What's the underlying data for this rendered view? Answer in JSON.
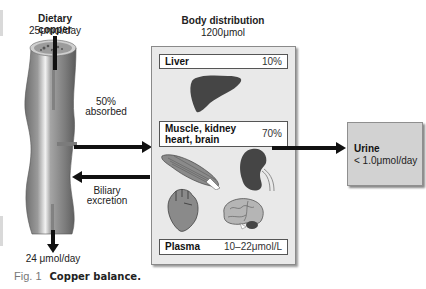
{
  "intake": {
    "title": "Dietary copper",
    "rate": "25μmol/day"
  },
  "distribution": {
    "title": "Body distribution",
    "total": "1200μmol",
    "compartments": [
      {
        "name": "Liver",
        "percent": "10%"
      },
      {
        "name": "Muscle, kidney heart, brain",
        "name_line1": "Muscle, kidney",
        "name_line2": "heart, brain",
        "percent": "70%"
      },
      {
        "name": "Plasma",
        "value": "10–22μmol/L"
      }
    ]
  },
  "absorption": {
    "line1": "50%",
    "line2": "absorbed"
  },
  "excretion": {
    "line1": "Biliary",
    "line2": "excretion"
  },
  "urine": {
    "title": "Urine",
    "value": "< 1.0μmol/day"
  },
  "fecal": {
    "value": "24 μmol/day"
  },
  "caption": {
    "label": "Fig. 1",
    "title": "Copper balance."
  },
  "colors": {
    "box_fill": "#e9e9e9",
    "urine_fill": "#d2d2d2",
    "arrow": "#111111",
    "organ_dark": "#4a4a4a"
  }
}
